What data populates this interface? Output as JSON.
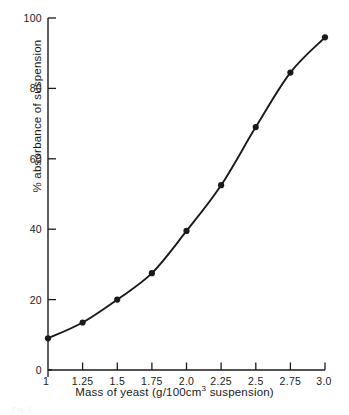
{
  "figure": {
    "background_color": "#ffffff",
    "ink_color": "#1a1a1a",
    "caption_sliver": "Fig. 1"
  },
  "axes": {
    "x": {
      "title_main": "Mass of yeast (g/100cm",
      "title_sup": "3",
      "title_tail": " suspension)",
      "title_full": "Mass of yeast (g/100cm3 suspension)",
      "tick_labels": [
        "1",
        "1.25",
        "1.5",
        "1.75",
        "2.0",
        "2.25",
        "2.5",
        "2.75",
        "3.0"
      ],
      "min": 1.0,
      "max": 3.0
    },
    "y": {
      "title": "% absorbance of suspension",
      "tick_labels": [
        "0",
        "20",
        "40",
        "60",
        "80",
        "100"
      ],
      "min": 0,
      "max": 100
    }
  },
  "chart_data": {
    "type": "line",
    "title": "",
    "xlabel": "Mass of yeast (g/100cm3 suspension)",
    "ylabel": "% absorbance of suspension",
    "xlim": [
      1.0,
      3.0
    ],
    "ylim": [
      0,
      100
    ],
    "xticks": [
      1.0,
      1.25,
      1.5,
      1.75,
      2.0,
      2.25,
      2.5,
      2.75,
      3.0
    ],
    "xticklabels": [
      "1",
      "1.25",
      "1.5",
      "1.75",
      "2.0",
      "2.25",
      "2.5",
      "2.75",
      "3.0"
    ],
    "yticks": [
      0,
      20,
      40,
      60,
      80,
      100
    ],
    "yticklabels": [
      "0",
      "20",
      "40",
      "60",
      "80",
      "100"
    ],
    "grid": false,
    "legend": false,
    "marker": "filled-circle",
    "line_style": "solid-smooth",
    "x": [
      1.0,
      1.25,
      1.5,
      1.75,
      2.0,
      2.25,
      2.5,
      2.75,
      3.0
    ],
    "values": [
      9,
      13.5,
      20,
      27.5,
      39.5,
      52.5,
      69,
      84.5,
      94.5
    ],
    "series": [
      {
        "name": "% absorbance of suspension",
        "x": [
          1.0,
          1.25,
          1.5,
          1.75,
          2.0,
          2.25,
          2.5,
          2.75,
          3.0
        ],
        "values": [
          9,
          13.5,
          20,
          27.5,
          39.5,
          52.5,
          69,
          84.5,
          94.5
        ]
      }
    ]
  }
}
